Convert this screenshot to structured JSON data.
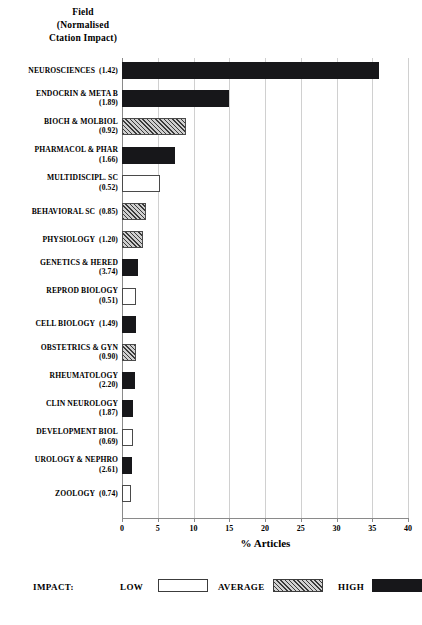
{
  "header": {
    "line1": "Field",
    "line2": "(Normalised",
    "line3": "Ctation Impact)"
  },
  "axis": {
    "xlabel": "% Articles",
    "ticks": [
      "0",
      "5",
      "10",
      "15",
      "20",
      "25",
      "30",
      "35",
      "40"
    ]
  },
  "legend": {
    "title": "IMPACT:",
    "items": [
      {
        "label": "LOW",
        "key": "low"
      },
      {
        "label": "AVERAGE",
        "key": "average"
      },
      {
        "label": "HIGH",
        "key": "high"
      }
    ]
  },
  "colors": {
    "high": "#17171a",
    "low": "#ffffff",
    "average": "#cfcfcf",
    "outline": "#4a4a4a",
    "grid": "#d0d0d0",
    "axis": "#8a8a8a"
  },
  "chart_data": {
    "type": "bar",
    "orientation": "horizontal",
    "title": "Field (Normalised Ctation Impact)",
    "xlabel": "% Articles",
    "ylabel": "",
    "xlim": [
      0,
      40
    ],
    "grid": true,
    "legend_position": "bottom",
    "legend_entries": [
      "LOW",
      "AVERAGE",
      "HIGH"
    ],
    "categories": [
      "NEUROSCIENCES",
      "ENDOCRIN & META B",
      "BIOCH & MOLBIOL",
      "PHARMACOL & PHAR",
      "MULTIDISCIPL. SC",
      "BEHAVIORAL SC",
      "PHYSIOLOGY",
      "GENETICS & HERED",
      "REPROD BIOLOGY",
      "CELL BIOLOGY",
      "OBSTETRICS & GYN",
      "RHEUMATOLOGY",
      "CLIN NEUROLOGY",
      "DEVELOPMENT BIOL",
      "UROLOGY & NEPHRO",
      "ZOOLOGY"
    ],
    "normalised_citation_impact": [
      1.42,
      1.89,
      0.92,
      1.66,
      0.52,
      0.85,
      1.2,
      3.74,
      0.51,
      1.49,
      0.9,
      2.2,
      1.87,
      0.69,
      2.61,
      0.74
    ],
    "values": [
      36.0,
      15.0,
      9.0,
      7.4,
      5.3,
      3.4,
      3.0,
      2.2,
      2.0,
      2.0,
      2.0,
      1.8,
      1.6,
      1.5,
      1.4,
      1.3
    ],
    "impact_class": [
      "high",
      "high",
      "average",
      "high",
      "low",
      "average",
      "average",
      "high",
      "low",
      "high",
      "average",
      "high",
      "high",
      "low",
      "high",
      "low"
    ],
    "bars": [
      {
        "label": "NEUROSCIENCES",
        "impact": "(1.42)",
        "value": 36.0,
        "class": "high",
        "label_inline": true
      },
      {
        "label": "ENDOCRIN & META B",
        "impact": "(1.89)",
        "value": 15.0,
        "class": "high",
        "label_inline": false
      },
      {
        "label": "BIOCH & MOLBIOL",
        "impact": "(0.92)",
        "value": 9.0,
        "class": "average",
        "label_inline": false
      },
      {
        "label": "PHARMACOL & PHAR",
        "impact": "(1.66)",
        "value": 7.4,
        "class": "high",
        "label_inline": false
      },
      {
        "label": "MULTIDISCIPL. SC",
        "impact": "(0.52)",
        "value": 5.3,
        "class": "low",
        "label_inline": false
      },
      {
        "label": "BEHAVIORAL SC",
        "impact": "(0.85)",
        "value": 3.4,
        "class": "average",
        "label_inline": true
      },
      {
        "label": "PHYSIOLOGY",
        "impact": "(1.20)",
        "value": 3.0,
        "class": "average",
        "label_inline": true
      },
      {
        "label": "GENETICS & HERED",
        "impact": "(3.74)",
        "value": 2.2,
        "class": "high",
        "label_inline": false
      },
      {
        "label": "REPROD BIOLOGY",
        "impact": "(0.51)",
        "value": 2.0,
        "class": "low",
        "label_inline": false
      },
      {
        "label": "CELL BIOLOGY",
        "impact": "(1.49)",
        "value": 2.0,
        "class": "high",
        "label_inline": true
      },
      {
        "label": "OBSTETRICS & GYN",
        "impact": "(0.90)",
        "value": 2.0,
        "class": "average",
        "label_inline": false
      },
      {
        "label": "RHEUMATOLOGY",
        "impact": "(2.20)",
        "value": 1.8,
        "class": "high",
        "label_inline": false
      },
      {
        "label": "CLIN NEUROLOGY",
        "impact": "(1.87)",
        "value": 1.6,
        "class": "high",
        "label_inline": false
      },
      {
        "label": "DEVELOPMENT BIOL",
        "impact": "(0.69)",
        "value": 1.5,
        "class": "low",
        "label_inline": false
      },
      {
        "label": "UROLOGY & NEPHRO",
        "impact": "(2.61)",
        "value": 1.4,
        "class": "high",
        "label_inline": false
      },
      {
        "label": "ZOOLOGY",
        "impact": "(0.74)",
        "value": 1.3,
        "class": "low",
        "label_inline": true
      }
    ]
  }
}
